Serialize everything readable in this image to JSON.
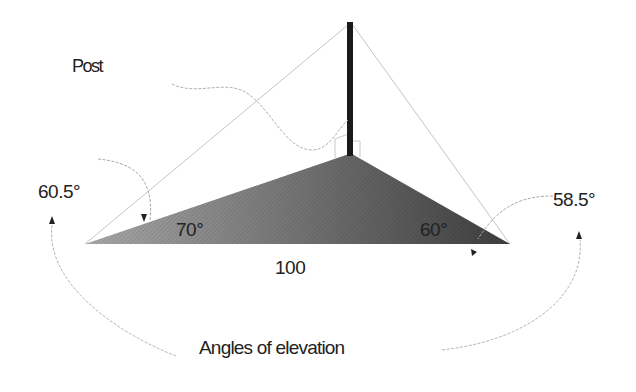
{
  "diagram": {
    "title": "Angles of elevation",
    "post_label": "Post",
    "base_length_label": "100",
    "base_angles": {
      "left": "70°",
      "right": "60°"
    },
    "elevation_angles": {
      "left": "60.5°",
      "right": "58.5°"
    },
    "colors": {
      "post": "#1a1a1a",
      "triangle_fill_light": "#9a9a9a",
      "triangle_fill_dark": "#4a4a4a",
      "sight_lines": "#bdbdbd",
      "arrows": "#9e9e9e",
      "text": "#222222"
    },
    "geometry": {
      "post_top": [
        350,
        22
      ],
      "post_base": [
        350,
        155
      ],
      "left_vertex": [
        85,
        244
      ],
      "right_vertex": [
        510,
        244
      ]
    }
  }
}
